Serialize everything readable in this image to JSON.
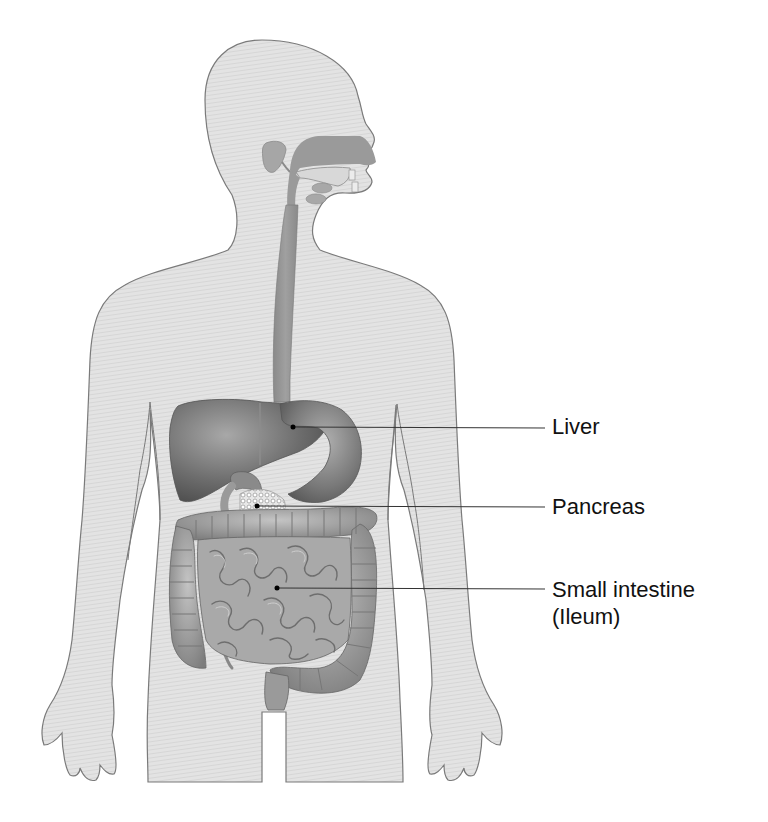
{
  "diagram": {
    "labels": [
      {
        "id": "liver",
        "text": "Liver",
        "sublabel": "",
        "anchor": [
          293,
          427
        ],
        "text_pos": [
          552,
          414
        ]
      },
      {
        "id": "pancreas",
        "text": "Pancreas",
        "sublabel": "",
        "anchor": [
          257,
          506
        ],
        "text_pos": [
          552,
          494
        ]
      },
      {
        "id": "small-intestine",
        "text": "Small intestine",
        "sublabel": "(Ileum)",
        "anchor": [
          277,
          588
        ],
        "text_pos": [
          552,
          576
        ]
      }
    ],
    "leader_line_end_x": 545
  },
  "colors": {
    "background": "#ffffff",
    "body_fill": "#e2e2e2",
    "body_outline": "#7a7a7a",
    "organ_dark": "#6e6e6e",
    "organ_mid": "#8f8f8f",
    "organ_light": "#b8b8b8",
    "leader_line": "#333333",
    "label_text": "#111111"
  }
}
